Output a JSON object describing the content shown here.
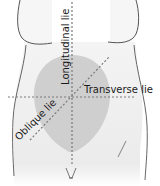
{
  "diagram": {
    "labels": {
      "longitudinal": "Longitudinal lie",
      "transverse": "Transverse lie",
      "oblique": "Oblique lie"
    },
    "colors": {
      "body_fill": "#ededed",
      "body_outline": "#555555",
      "uterus_fill": "#c8c8c8",
      "dashed_line": "#7a7a7a",
      "background": "#ffffff"
    }
  }
}
